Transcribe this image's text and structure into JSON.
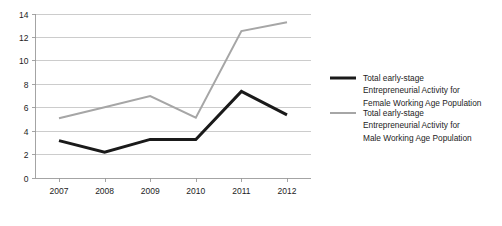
{
  "chart_data": {
    "type": "line",
    "title": "",
    "subtitle": "",
    "xlabel": "",
    "ylabel": "",
    "categories": [
      "2007",
      "2008",
      "2009",
      "2010",
      "2011",
      "2012"
    ],
    "x_tick_labels": [
      "2007",
      "2008",
      "2009",
      "2010",
      "2011",
      "2012"
    ],
    "y_tick_labels": [
      "0",
      "2",
      "4",
      "6",
      "8",
      "10",
      "12",
      "14"
    ],
    "y_ticks": [
      0,
      2,
      4,
      6,
      8,
      10,
      12,
      14
    ],
    "ylim": [
      0,
      14
    ],
    "grid": "horizontal",
    "legend_position": "right",
    "series": [
      {
        "name": "Total early-stage Entrepreneurial Activity for Female Working Age Population",
        "legend_line1": "Total early-stage",
        "legend_line2": "Entrepreneurial Activity for",
        "legend_line3": "Female Working Age Population",
        "color": "#1a1a1a",
        "width": 3.0,
        "values": [
          3.15,
          2.15,
          3.25,
          3.25,
          7.35,
          5.35
        ]
      },
      {
        "name": "Total early-stage Entrepreneurial Activity for Male Working Age Population",
        "legend_line1": "Total early-stage",
        "legend_line2": "Entrepreneurial Activity for",
        "legend_line3": "Male Working Age Population",
        "color": "#a6a6a6",
        "width": 2.0,
        "values": [
          5.05,
          6.0,
          6.95,
          5.1,
          12.5,
          13.25
        ]
      }
    ]
  },
  "colors": {
    "background": "#ffffff",
    "gridline": "#bfbfbf",
    "axis": "#9a9a9a",
    "text": "#1d1d1d",
    "female_series": "#1a1a1a",
    "male_series": "#a6a6a6"
  }
}
